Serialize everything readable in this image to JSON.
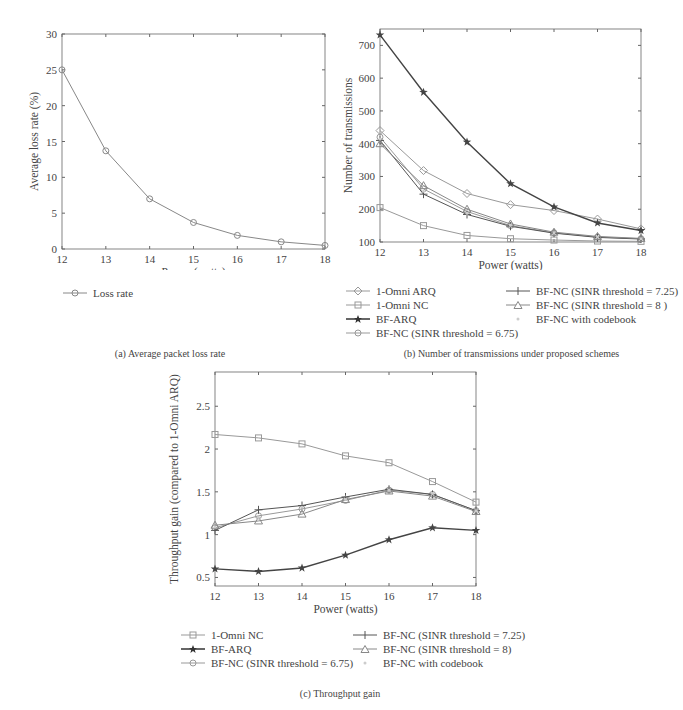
{
  "chart_data": [
    {
      "id": "a",
      "type": "line",
      "title": "",
      "caption": "(a)  Average packet loss rate",
      "xlabel": "Power (watts)",
      "ylabel": "Average loss rate (%)",
      "x": [
        12,
        13,
        14,
        15,
        16,
        17,
        18
      ],
      "xlim": [
        12,
        18
      ],
      "ylim": [
        0,
        30
      ],
      "xticks": [
        12,
        13,
        14,
        15,
        16,
        17,
        18
      ],
      "yticks": [
        0,
        5,
        10,
        15,
        20,
        25,
        30
      ],
      "grid": false,
      "legend_position": "below",
      "series": [
        {
          "name": "Loss rate",
          "marker": "circle",
          "color": "#888888",
          "values": [
            25.0,
            13.7,
            7.0,
            3.7,
            1.9,
            1.0,
            0.5
          ]
        }
      ]
    },
    {
      "id": "b",
      "type": "line",
      "title": "",
      "caption": "(b)  Number of transmissions under proposed schemes",
      "xlabel": "Power (watts)",
      "ylabel": "Number of transmissions",
      "x": [
        12,
        13,
        14,
        15,
        16,
        17,
        18
      ],
      "xlim": [
        12,
        18
      ],
      "ylim": [
        100,
        750
      ],
      "xticks": [
        12,
        13,
        14,
        15,
        16,
        17,
        18
      ],
      "yticks": [
        100,
        200,
        300,
        400,
        500,
        600,
        700
      ],
      "grid": false,
      "legend_position": "below",
      "series": [
        {
          "name": "1-Omni ARQ",
          "marker": "diamond",
          "color": "#999999",
          "values": [
            440,
            318,
            248,
            214,
            196,
            170,
            140
          ]
        },
        {
          "name": "1-Omni NC",
          "marker": "square",
          "color": "#999999",
          "values": [
            205,
            150,
            120,
            110,
            106,
            103,
            102
          ]
        },
        {
          "name": "BF-ARQ",
          "marker": "star",
          "color": "#444444",
          "values": [
            732,
            557,
            405,
            278,
            207,
            158,
            135
          ]
        },
        {
          "name": "BF-NC (SINR threshold = 6.75)",
          "marker": "circle",
          "color": "#999999",
          "values": [
            420,
            262,
            193,
            150,
            128,
            115,
            110
          ]
        },
        {
          "name": "BF-NC (SINR threshold = 7.25)",
          "marker": "plus",
          "color": "#555555",
          "values": [
            410,
            246,
            184,
            148,
            127,
            114,
            109
          ]
        },
        {
          "name": "BF-NC (SINR threshold = 8 )",
          "marker": "triangle",
          "color": "#888888",
          "values": [
            400,
            272,
            200,
            155,
            130,
            117,
            111
          ]
        },
        {
          "name": "BF-NC with codebook",
          "marker": "dot",
          "color": "#cccccc",
          "values": [
            415,
            255,
            188,
            151,
            128,
            115,
            110
          ]
        }
      ]
    },
    {
      "id": "c",
      "type": "line",
      "title": "",
      "caption": "(c)  Throughput gain",
      "xlabel": "Power (watts)",
      "ylabel": "Throughput gain (compared to 1-Omni ARQ)",
      "x": [
        12,
        13,
        14,
        15,
        16,
        17,
        18
      ],
      "xlim": [
        12,
        18
      ],
      "ylim": [
        0.4,
        2.9
      ],
      "xticks": [
        12,
        13,
        14,
        15,
        16,
        17,
        18
      ],
      "yticks": [
        0.5,
        1,
        1.5,
        2,
        2.5
      ],
      "grid": false,
      "legend_position": "below",
      "series": [
        {
          "name": "1-Omni NC",
          "marker": "square",
          "color": "#999999",
          "values": [
            2.17,
            2.13,
            2.06,
            1.92,
            1.84,
            1.62,
            1.38
          ]
        },
        {
          "name": "BF-ARQ",
          "marker": "star",
          "color": "#444444",
          "values": [
            0.6,
            0.57,
            0.61,
            0.76,
            0.94,
            1.08,
            1.05
          ]
        },
        {
          "name": "BF-NC (SINR threshold = 6.75)",
          "marker": "circle",
          "color": "#999999",
          "values": [
            1.08,
            1.22,
            1.3,
            1.4,
            1.52,
            1.47,
            1.28
          ]
        },
        {
          "name": "BF-NC (SINR threshold = 7.25)",
          "marker": "plus",
          "color": "#555555",
          "values": [
            1.05,
            1.29,
            1.34,
            1.44,
            1.53,
            1.47,
            1.28
          ]
        },
        {
          "name": "BF-NC (SINR threshold = 8)",
          "marker": "triangle",
          "color": "#888888",
          "values": [
            1.11,
            1.16,
            1.24,
            1.41,
            1.51,
            1.45,
            1.27
          ]
        },
        {
          "name": "BF-NC with codebook",
          "marker": "dot",
          "color": "#cccccc",
          "values": [
            1.09,
            1.2,
            1.32,
            1.41,
            1.52,
            1.48,
            1.28
          ]
        }
      ]
    }
  ],
  "legends": {
    "a": [
      "Loss rate"
    ],
    "b_left": [
      "1-Omni ARQ",
      "1-Omni NC",
      "BF-ARQ",
      "BF-NC (SINR threshold = 6.75)"
    ],
    "b_right": [
      "BF-NC (SINR threshold = 7.25)",
      "BF-NC (SINR threshold = 8 )",
      "BF-NC with codebook"
    ],
    "c_left": [
      "1-Omni NC",
      "BF-ARQ",
      "BF-NC (SINR threshold = 6.75)"
    ],
    "c_right": [
      "BF-NC (SINR threshold = 7.25)",
      "BF-NC (SINR threshold = 8)",
      "BF-NC with codebook"
    ]
  },
  "captions": {
    "a": "(a)  Average packet loss rate",
    "b": "(b)  Number of transmissions under proposed schemes",
    "c": "(c)  Throughput gain"
  }
}
